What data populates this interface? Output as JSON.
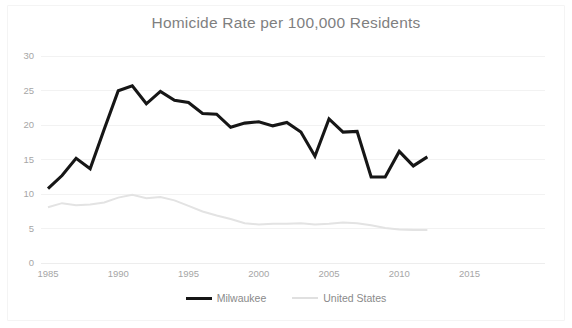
{
  "chart_data": {
    "type": "line",
    "title": "Homicide Rate per 100,000 Residents",
    "xlabel": "",
    "ylabel": "",
    "xlim": [
      1984,
      2017
    ],
    "ylim": [
      0,
      30
    ],
    "ytick_labels": [
      "0",
      "5",
      "10",
      "15",
      "20",
      "25",
      "30"
    ],
    "yticks": [
      0,
      5,
      10,
      15,
      20,
      25,
      30
    ],
    "xtick_labels": [
      "1985",
      "1990",
      "1995",
      "2000",
      "2005",
      "2010",
      "2015"
    ],
    "xticks": [
      1985,
      1990,
      1995,
      2000,
      2005,
      2010,
      2015
    ],
    "grid": true,
    "legend_position": "bottom",
    "x": [
      1985,
      1986,
      1987,
      1988,
      1989,
      1990,
      1991,
      1992,
      1993,
      1994,
      1995,
      1996,
      1997,
      1998,
      1999,
      2000,
      2001,
      2002,
      2003,
      2004,
      2005,
      2006,
      2007,
      2008,
      2009,
      2010,
      2011,
      2012
    ],
    "series": [
      {
        "name": "Milwaukee",
        "color": "#161616",
        "width": 3.1,
        "values": [
          10.7,
          12.6,
          15.1,
          13.6,
          19.3,
          24.9,
          25.6,
          23.0,
          24.8,
          23.5,
          23.2,
          21.6,
          21.5,
          19.6,
          20.2,
          20.4,
          19.8,
          20.3,
          18.9,
          15.4,
          20.8,
          18.9,
          19.0,
          12.4,
          12.4,
          16.1,
          14.0,
          15.3
        ]
      },
      {
        "name": "United States",
        "color": "#e3e3e3",
        "width": 2.0,
        "values": [
          8.0,
          8.6,
          8.3,
          8.4,
          8.7,
          9.4,
          9.8,
          9.3,
          9.5,
          9.0,
          8.2,
          7.4,
          6.8,
          6.3,
          5.7,
          5.5,
          5.6,
          5.6,
          5.7,
          5.5,
          5.6,
          5.8,
          5.7,
          5.4,
          5.0,
          4.8,
          4.7,
          4.7
        ]
      }
    ]
  },
  "legend": {
    "items": [
      {
        "label": "Milwaukee",
        "color": "#161616"
      },
      {
        "label": "United States",
        "color": "#e0e0e0"
      }
    ]
  }
}
